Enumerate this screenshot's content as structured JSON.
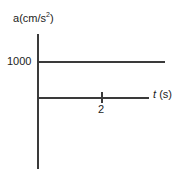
{
  "chart_data": {
    "type": "line",
    "title": "",
    "subtitle": "",
    "xlabel": "t (s)",
    "xlabel_symbol": "t",
    "xlabel_unit": "(s)",
    "ylabel": "a(cm/s2)",
    "ylabel_symbol": "a",
    "ylabel_unit": "(cm/s",
    "ylabel_exponent": "2",
    "ylabel_unit_close": ")",
    "x_ticks": [
      2
    ],
    "x_tick_labels": [
      "2"
    ],
    "y_ticks": [
      1000
    ],
    "y_tick_labels": [
      "1000"
    ],
    "xlim": [
      0,
      3.6
    ],
    "ylim": [
      0,
      1450
    ],
    "grid": false,
    "legend": false,
    "series": [
      {
        "name": "acceleration",
        "x": [
          0,
          3.0
        ],
        "values": [
          1000,
          1000
        ]
      }
    ],
    "annotations": [],
    "colors": {
      "axis": "#3a3a3a",
      "line": "#3a3a3a",
      "text": "#1c1c1c",
      "background": "#ffffff"
    }
  }
}
